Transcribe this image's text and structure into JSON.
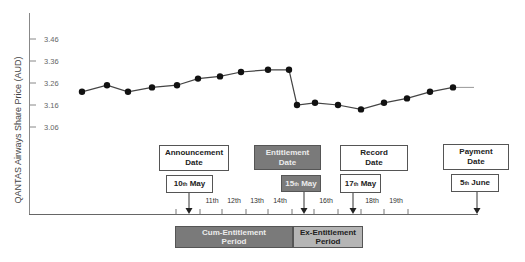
{
  "chart_data": {
    "type": "line",
    "title": "",
    "ylabel": "QANTAS Airways Share Price (AUD)",
    "xlabel": "",
    "yticks": [
      3.46,
      3.36,
      3.26,
      3.16,
      3.06
    ],
    "ytick_labels": [
      "3.46",
      "3.36",
      "3.26",
      "3.16",
      "3.06"
    ],
    "ylim": [
      2.94,
      3.56
    ],
    "grid": false,
    "legend": null,
    "series": [
      {
        "name": "QANTAS share price",
        "values": [
          3.22,
          3.25,
          3.22,
          3.24,
          3.25,
          3.28,
          3.29,
          3.31,
          3.32,
          3.32,
          3.16,
          3.17,
          3.16,
          3.14,
          3.17,
          3.19,
          3.22,
          3.24
        ],
        "x_px": [
          82,
          107,
          128,
          152,
          177,
          198,
          220,
          241,
          268,
          289,
          297,
          315,
          338,
          361,
          384,
          407,
          430,
          453
        ]
      }
    ],
    "trailing_segment": {
      "from_x": 453,
      "to_x": 474,
      "value": 3.24
    }
  },
  "timeline": {
    "day_labels": [
      {
        "text": "11th",
        "x": 212
      },
      {
        "text": "12th",
        "x": 234
      },
      {
        "text": "13th",
        "x": 257
      },
      {
        "text": "14th",
        "x": 280
      },
      {
        "text": "16th",
        "x": 326
      },
      {
        "text": "18th",
        "x": 372
      },
      {
        "text": "19th",
        "x": 396
      }
    ],
    "events": [
      {
        "label_line1": "Announcement",
        "label_line2": "Date",
        "date_num": "10",
        "date_sup": "th",
        "date_rest": " May",
        "style": "white"
      },
      {
        "label_line1": "Entitlement",
        "label_line2": "Date",
        "date_num": "15",
        "date_sup": "th",
        "date_rest": " May",
        "style": "dark"
      },
      {
        "label_line1": "Record",
        "label_line2": "Date",
        "date_num": "17",
        "date_sup": "th",
        "date_rest": " May",
        "style": "white"
      },
      {
        "label_line1": "Payment",
        "label_line2": "Date",
        "date_num": "5",
        "date_sup": "th",
        "date_rest": " June",
        "style": "white"
      }
    ],
    "periods": [
      {
        "line1": "Cum-Entitlement",
        "line2": "Period",
        "color": "#7a7a7a"
      },
      {
        "line1": "Ex-Entitlement",
        "line2": "Period",
        "color": "#b5b5b5"
      }
    ]
  },
  "colors": {
    "line": "#444444",
    "marker": "#111111",
    "axis": "#777777",
    "dark_box": "#7a7a7a",
    "mid_box": "#b5b5b5"
  }
}
